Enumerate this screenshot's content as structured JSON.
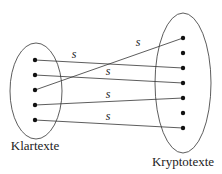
{
  "diagram": {
    "left_set": {
      "label": "Klartexte",
      "cx": 36,
      "cy": 91,
      "rx": 26,
      "ry": 48,
      "label_x": 35,
      "label_y": 150,
      "points": [
        {
          "x": 35,
          "y": 60
        },
        {
          "x": 35,
          "y": 75
        },
        {
          "x": 35,
          "y": 90
        },
        {
          "x": 35,
          "y": 105
        },
        {
          "x": 35,
          "y": 120
        }
      ]
    },
    "right_set": {
      "label": "Kryptotexte",
      "cx": 183,
      "cy": 83,
      "rx": 28,
      "ry": 70,
      "label_x": 183,
      "label_y": 166,
      "points": [
        {
          "x": 183,
          "y": 38
        },
        {
          "x": 183,
          "y": 53
        },
        {
          "x": 183,
          "y": 68
        },
        {
          "x": 183,
          "y": 83
        },
        {
          "x": 183,
          "y": 98
        },
        {
          "x": 183,
          "y": 113
        },
        {
          "x": 183,
          "y": 128
        }
      ]
    },
    "edges": [
      {
        "from": 0,
        "to": 2,
        "label": "s",
        "lx": 74,
        "ly": 58
      },
      {
        "from": 1,
        "to": 3,
        "label": "s",
        "lx": 108,
        "ly": 75
      },
      {
        "from": 2,
        "to": 0,
        "label": "s",
        "lx": 138,
        "ly": 46
      },
      {
        "from": 3,
        "to": 4,
        "label": "s",
        "lx": 108,
        "ly": 98
      },
      {
        "from": 4,
        "to": 6,
        "label": "s",
        "lx": 108,
        "ly": 120
      }
    ],
    "stroke_color": "#333333",
    "dot_color": "#111111"
  }
}
